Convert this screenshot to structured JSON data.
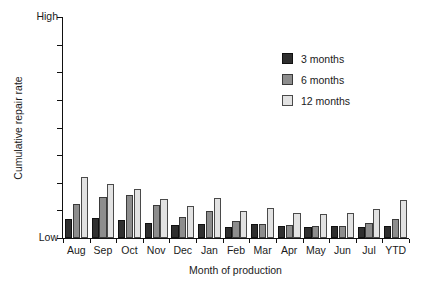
{
  "chart_data": {
    "type": "bar",
    "title": "",
    "xlabel": "Month of production",
    "ylabel": "Cumulative repair rate",
    "categories": [
      "Aug",
      "Sep",
      "Oct",
      "Nov",
      "Dec",
      "Jan",
      "Feb",
      "Mar",
      "Apr",
      "May",
      "Jun",
      "Jul",
      "YTD"
    ],
    "series": [
      {
        "name": "3 months",
        "color": "#2f2f2f",
        "values": [
          8.5,
          9.0,
          8.0,
          7.0,
          6.0,
          6.5,
          5.0,
          6.5,
          5.5,
          5.0,
          5.5,
          5.0,
          5.5
        ]
      },
      {
        "name": "6 months",
        "color": "#8d8d8d",
        "values": [
          15.5,
          18.5,
          19.5,
          15.0,
          9.5,
          12.0,
          7.5,
          6.5,
          6.0,
          5.5,
          5.5,
          7.0,
          8.5
        ]
      },
      {
        "name": "12 months",
        "color": "#e2e2e2",
        "values": [
          27.5,
          24.5,
          22.0,
          17.5,
          14.5,
          18.0,
          12.0,
          13.5,
          11.5,
          11.0,
          11.5,
          13.0,
          17.0
        ]
      }
    ],
    "ylim": [
      0,
      100
    ],
    "ytick_labels_visible": [
      "High",
      "Low"
    ],
    "ytick_count": 9,
    "grid": false,
    "legend_position": "upper-right",
    "legend_entries": [
      "3 months",
      "6 months",
      "12 months"
    ]
  },
  "axis": {
    "y_high_label": "High",
    "y_low_label": "Low",
    "y_title": "Cumulative repair rate",
    "x_title": "Month of production"
  },
  "colors": {
    "series_3_months": "#2f2f2f",
    "series_6_months": "#8d8d8d",
    "series_12_months": "#e2e2e2",
    "axis": "#111111",
    "background": "#ffffff"
  }
}
